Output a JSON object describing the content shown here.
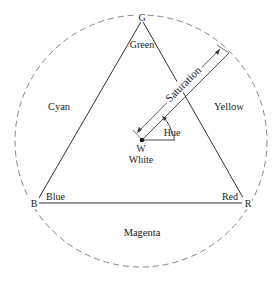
{
  "diagram": {
    "type": "HSI color triangle",
    "vertices": {
      "green": {
        "letter": "G",
        "name": "Green"
      },
      "blue": {
        "letter": "B",
        "name": "Blue"
      },
      "red": {
        "letter": "R",
        "name": "Red"
      }
    },
    "complements": {
      "cyan": "Cyan",
      "yellow": "Yellow",
      "magenta": "Magenta"
    },
    "center": {
      "letter": "W",
      "name": "White"
    },
    "measures": {
      "saturation": "Saturation",
      "hue": "Hue"
    },
    "colors": {
      "line": "#333333",
      "circle": "#777777",
      "background": "#ffffff"
    }
  }
}
